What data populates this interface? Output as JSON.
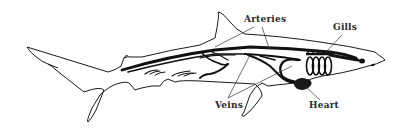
{
  "diagram": {
    "labels": {
      "arteries": "Arteries",
      "gills": "Gills",
      "veins": "Veins",
      "heart": "Heart"
    },
    "colors": {
      "outline": "#1a1a1a",
      "vessels": "#111111",
      "background": "#ffffff",
      "label_text": "#2a2a2a"
    }
  }
}
